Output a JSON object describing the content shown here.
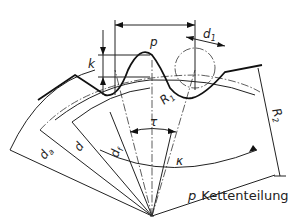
{
  "diagram": {
    "labels": {
      "p": "p",
      "d1": "d",
      "d1_sub": "1",
      "k": "k",
      "R1": "R",
      "R1_sub": "1",
      "R2": "R",
      "R2_sub": "2",
      "da": "d",
      "da_sub": "a",
      "d": "d",
      "df": "d",
      "df_sub": "f",
      "tau": "τ",
      "kappa": "κ"
    },
    "caption": {
      "symbol": "p",
      "text": "Kettenteilung"
    }
  }
}
